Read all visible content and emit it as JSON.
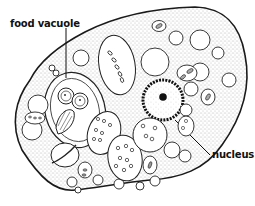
{
  "diagram": {
    "labels": [
      {
        "id": "food-vacuole",
        "text": "food vacuole",
        "x": 10,
        "y": 18
      },
      {
        "id": "nucleus",
        "text": "nucleus",
        "x": 212,
        "y": 49
      }
    ],
    "colors": {
      "outline": "#1a1a1a",
      "background": "#ffffff",
      "stipple": "#555555"
    }
  }
}
